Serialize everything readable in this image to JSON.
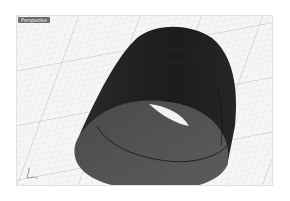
{
  "viewport": {
    "label": "Perspective",
    "background": "#f4f4f4",
    "grid_color": "#d6d6d6",
    "grid_major_color": "#b8b8b8"
  },
  "model": {
    "object": "cylinder-shell",
    "outer_color": "#1f1f1f",
    "inner_color": "#555555",
    "edge_color": "#111111"
  },
  "axis_widget": {
    "x_label": "x",
    "y_label": "y"
  }
}
